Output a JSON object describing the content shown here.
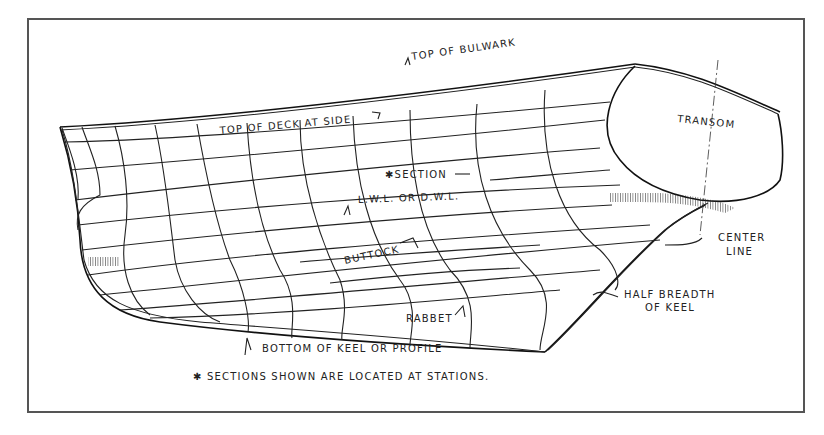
{
  "figure": {
    "type": "lines plan perspective of boat hull",
    "colors": {
      "ink": "#222222",
      "frame": "#555555",
      "background": "#ffffff"
    },
    "labels": {
      "top_of_bulwark": "TOP OF BULWARK",
      "top_of_deck": "TOP OF DECK AT SIDE",
      "transom": "TRANSOM",
      "section": "✱SECTION",
      "lwl": "L.W.L. OR D.W.L.",
      "buttock": "BUTTOCK",
      "center_line_1": "CENTER",
      "center_line_2": "LINE",
      "half_breadth_1": "HALF BREADTH",
      "half_breadth_2": "OF KEEL",
      "rabbet": "RABBET",
      "bottom_keel": "BOTTOM OF KEEL OR PROFILE"
    },
    "footnote": "✱ SECTIONS SHOWN ARE LOCATED AT STATIONS."
  }
}
